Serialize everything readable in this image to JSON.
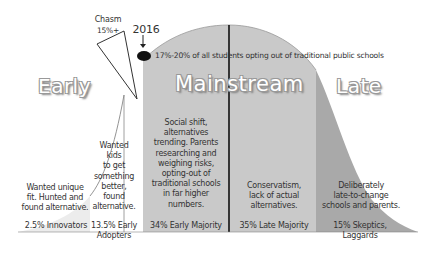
{
  "diagram": {
    "type": "adoption-curve",
    "segments": [
      {
        "id": "innovators",
        "label": "2.5% Innovators",
        "share_percent": 2.5,
        "description": "Wanted unique fit. Hunted and found alternative.",
        "fill": "#ececec"
      },
      {
        "id": "early-adopters",
        "label": "13.5% Early Adopters",
        "label_lines": [
          "13.5% Early",
          "Adopters"
        ],
        "share_percent": 13.5,
        "description_lines": [
          "Wanted",
          "kids",
          "to get",
          "something",
          "better,",
          "found",
          "alternative."
        ],
        "fill": "#ffffff"
      },
      {
        "id": "early-majority",
        "label": "34% Early Majority",
        "share_percent": 34,
        "description_lines": [
          "Social shift,",
          "alternatives",
          "trending. Parents",
          "researching and",
          "weighing risks,",
          "opting-out of",
          "traditional schools",
          "in far higher",
          "numbers."
        ],
        "fill": "#c9c9c9"
      },
      {
        "id": "late-majority",
        "label": "35% Late Majority",
        "share_percent": 35,
        "description_lines": [
          "Conservatism,",
          "lack of actual",
          "alternatives."
        ],
        "fill": "#c9c9c9"
      },
      {
        "id": "laggards",
        "label": "15% Skeptics, Laggards",
        "label_lines": [
          "15% Skeptics,",
          "Laggards"
        ],
        "share_percent": 15,
        "description_lines": [
          "Deliberately",
          "late-to-change",
          "schools and parents."
        ],
        "fill": "#a9a9a9"
      }
    ],
    "innovators_desc_lines": [
      "Wanted unique",
      "fit. Hunted and",
      "found alternative."
    ],
    "phases": {
      "early": "Early",
      "mainstream": "Mainstream",
      "late": "Late"
    },
    "chasm": {
      "title": "Chasm",
      "value": "15%+"
    },
    "marker": {
      "year": "2016",
      "note": "17%-20% of all students opting out of traditional public schools"
    }
  }
}
